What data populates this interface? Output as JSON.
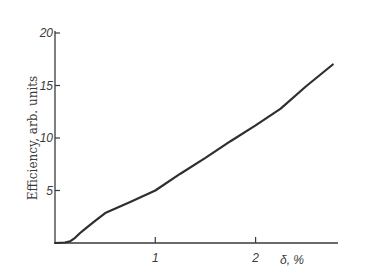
{
  "chart_data": {
    "type": "line",
    "title": "",
    "xlabel": "δ, %",
    "ylabel": "Efficiency, arb. units",
    "xlim": [
      0,
      2.83
    ],
    "ylim": [
      0,
      20
    ],
    "x_ticks": [
      1,
      2
    ],
    "x_tick_labels": [
      "1",
      "2"
    ],
    "y_ticks": [
      5,
      10,
      15,
      20
    ],
    "y_tick_labels": [
      "5",
      "10",
      "15",
      "20"
    ],
    "grid": false,
    "legend": null,
    "series": [
      {
        "name": "Efficiency",
        "color": "#2e2e2e",
        "x": [
          0.0,
          0.1,
          0.15,
          0.2,
          0.25,
          0.3,
          0.4,
          0.5,
          0.75,
          1.0,
          1.25,
          1.5,
          1.75,
          2.0,
          2.25,
          2.5,
          2.77
        ],
        "y": [
          0.0,
          0.05,
          0.15,
          0.5,
          0.95,
          1.35,
          2.1,
          2.85,
          3.9,
          5.0,
          6.6,
          8.1,
          9.7,
          11.2,
          12.8,
          14.9,
          17.0
        ]
      }
    ]
  },
  "labels": {
    "ylabel": "Efficiency, arb. units",
    "xlabel": "δ, %",
    "x_ticks": [
      "1",
      "2"
    ],
    "y_ticks": [
      "5",
      "10",
      "15",
      "20"
    ]
  }
}
